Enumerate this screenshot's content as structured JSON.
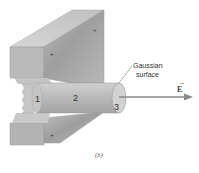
{
  "figure": {
    "caption": "(b)",
    "callout": {
      "line1": "Gaussian",
      "line2": "surface"
    },
    "field_label": "E",
    "field_arrow_mark": "→",
    "regions": [
      {
        "id": "1",
        "label": "1"
      },
      {
        "id": "2",
        "label": "2"
      },
      {
        "id": "3",
        "label": "3"
      }
    ],
    "charge_marks": [
      "+",
      "+",
      "+"
    ],
    "colors": {
      "plate_top": "#c9c9c9",
      "plate_front": "#b5b5b5",
      "plate_face": "#a8a8a8",
      "cylinder": "#bdbdbd",
      "cylinder_end": "#d2d2d2",
      "arrow": "#8a8a8a",
      "text": "#333333"
    }
  }
}
